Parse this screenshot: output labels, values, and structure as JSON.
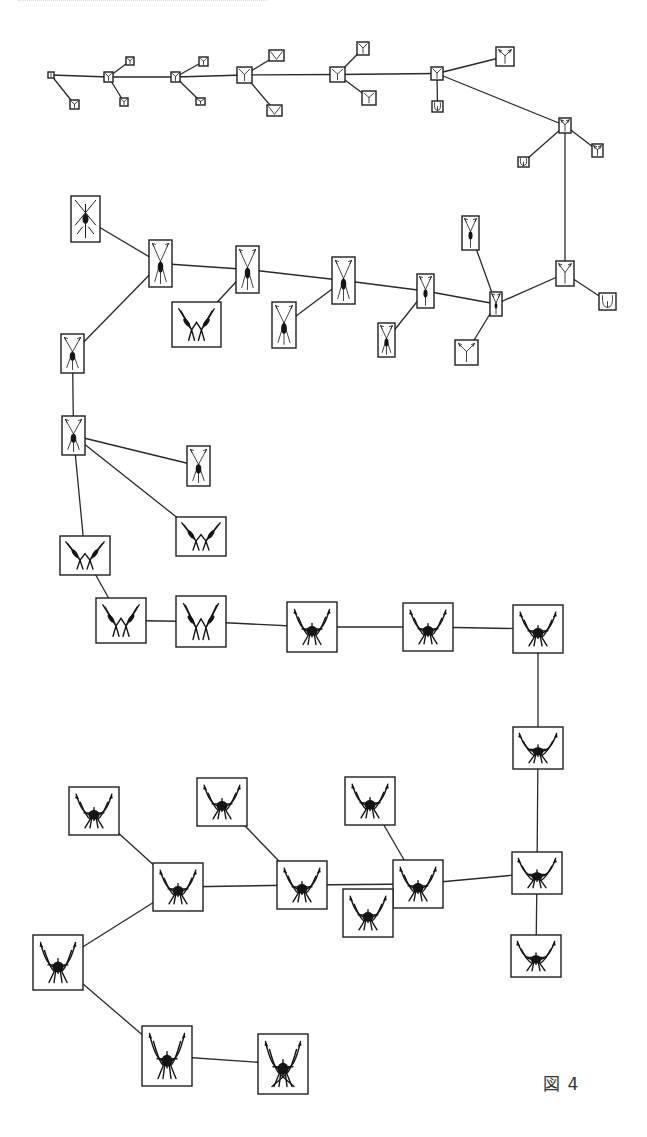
{
  "figure": {
    "caption": "図 4",
    "colors": {
      "line": "#2a2a2a",
      "box": "#1e1e1e",
      "glyph": "#151515",
      "background": "#ffffff"
    }
  },
  "nodes": [
    {
      "id": "n0",
      "x": 48,
      "y": 72,
      "w": 6,
      "h": 6,
      "gen": 0
    },
    {
      "id": "n0a",
      "x": 70,
      "y": 100,
      "w": 9,
      "h": 9,
      "gen": 0
    },
    {
      "id": "n1",
      "x": 104,
      "y": 72,
      "w": 9,
      "h": 10,
      "gen": 1
    },
    {
      "id": "n1a",
      "x": 126,
      "y": 57,
      "w": 8,
      "h": 8,
      "gen": 1
    },
    {
      "id": "n1b",
      "x": 120,
      "y": 98,
      "w": 8,
      "h": 8,
      "gen": 1
    },
    {
      "id": "n2",
      "x": 171,
      "y": 72,
      "w": 9,
      "h": 10,
      "gen": 1
    },
    {
      "id": "n2a",
      "x": 199,
      "y": 57,
      "w": 9,
      "h": 9,
      "gen": 1
    },
    {
      "id": "n2b",
      "x": 196,
      "y": 98,
      "w": 9,
      "h": 7,
      "gen": 0
    },
    {
      "id": "n3",
      "x": 237,
      "y": 67,
      "w": 15,
      "h": 16,
      "gen": 2
    },
    {
      "id": "n3a",
      "x": 269,
      "y": 50,
      "w": 15,
      "h": 11,
      "gen": 2,
      "shape": "v"
    },
    {
      "id": "n3b",
      "x": 267,
      "y": 105,
      "w": 15,
      "h": 11,
      "gen": 2,
      "shape": "v"
    },
    {
      "id": "n4",
      "x": 330,
      "y": 67,
      "w": 15,
      "h": 15,
      "gen": 2
    },
    {
      "id": "n4a",
      "x": 357,
      "y": 42,
      "w": 12,
      "h": 13,
      "gen": 2
    },
    {
      "id": "n4b",
      "x": 362,
      "y": 91,
      "w": 14,
      "h": 14,
      "gen": 2
    },
    {
      "id": "n5",
      "x": 431,
      "y": 67,
      "w": 12,
      "h": 13,
      "gen": 2
    },
    {
      "id": "n5a",
      "x": 432,
      "y": 101,
      "w": 11,
      "h": 11,
      "gen": 2,
      "shape": "u"
    },
    {
      "id": "n5b",
      "x": 496,
      "y": 47,
      "w": 18,
      "h": 19,
      "gen": 3
    },
    {
      "id": "n6",
      "x": 559,
      "y": 118,
      "w": 12,
      "h": 15,
      "gen": 3
    },
    {
      "id": "n6a",
      "x": 518,
      "y": 157,
      "w": 11,
      "h": 10,
      "gen": 2,
      "shape": "u"
    },
    {
      "id": "n6b",
      "x": 592,
      "y": 144,
      "w": 11,
      "h": 13,
      "gen": 3
    },
    {
      "id": "n7",
      "x": 556,
      "y": 261,
      "w": 18,
      "h": 25,
      "gen": 3
    },
    {
      "id": "n7a",
      "x": 599,
      "y": 293,
      "w": 17,
      "h": 17,
      "gen": 3,
      "shape": "u"
    },
    {
      "id": "n8",
      "x": 490,
      "y": 292,
      "w": 12,
      "h": 24,
      "gen": 4
    },
    {
      "id": "n8a",
      "x": 462,
      "y": 216,
      "w": 17,
      "h": 34,
      "gen": 4
    },
    {
      "id": "n8b",
      "x": 455,
      "y": 340,
      "w": 23,
      "h": 25,
      "gen": 3
    },
    {
      "id": "n9",
      "x": 417,
      "y": 274,
      "w": 17,
      "h": 34,
      "gen": 4
    },
    {
      "id": "n9a",
      "x": 378,
      "y": 323,
      "w": 17,
      "h": 34,
      "gen": 5
    },
    {
      "id": "n10",
      "x": 332,
      "y": 257,
      "w": 23,
      "h": 47,
      "gen": 5
    },
    {
      "id": "n10a",
      "x": 272,
      "y": 302,
      "w": 24,
      "h": 46,
      "gen": 5
    },
    {
      "id": "n11",
      "x": 236,
      "y": 246,
      "w": 23,
      "h": 47,
      "gen": 6
    },
    {
      "id": "n11a",
      "x": 172,
      "y": 302,
      "w": 49,
      "h": 45,
      "gen": 7,
      "shape": "w"
    },
    {
      "id": "n12",
      "x": 149,
      "y": 240,
      "w": 23,
      "h": 47,
      "gen": 6
    },
    {
      "id": "n12a",
      "x": 71,
      "y": 196,
      "w": 29,
      "h": 46,
      "gen": 6,
      "shape": "x"
    },
    {
      "id": "n13",
      "x": 61,
      "y": 334,
      "w": 23,
      "h": 39,
      "gen": 6
    },
    {
      "id": "n14",
      "x": 62,
      "y": 416,
      "w": 23,
      "h": 39,
      "gen": 6
    },
    {
      "id": "n14a",
      "x": 187,
      "y": 446,
      "w": 23,
      "h": 40,
      "gen": 6
    },
    {
      "id": "n14b",
      "x": 176,
      "y": 517,
      "w": 50,
      "h": 39,
      "gen": 7,
      "shape": "w"
    },
    {
      "id": "n15",
      "x": 60,
      "y": 536,
      "w": 50,
      "h": 39,
      "gen": 7,
      "shape": "w"
    },
    {
      "id": "n16",
      "x": 96,
      "y": 598,
      "w": 50,
      "h": 45,
      "gen": 8,
      "shape": "w"
    },
    {
      "id": "n17",
      "x": 176,
      "y": 596,
      "w": 50,
      "h": 51,
      "gen": 8,
      "shape": "w"
    },
    {
      "id": "n18",
      "x": 287,
      "y": 602,
      "w": 50,
      "h": 50,
      "gen": 9,
      "shape": "bug"
    },
    {
      "id": "n19",
      "x": 403,
      "y": 603,
      "w": 50,
      "h": 48,
      "gen": 9,
      "shape": "bug"
    },
    {
      "id": "n20",
      "x": 513,
      "y": 605,
      "w": 50,
      "h": 48,
      "gen": 10,
      "shape": "bug"
    },
    {
      "id": "n21",
      "x": 513,
      "y": 727,
      "w": 50,
      "h": 42,
      "gen": 10,
      "shape": "bug"
    },
    {
      "id": "n22",
      "x": 512,
      "y": 852,
      "w": 50,
      "h": 42,
      "gen": 10,
      "shape": "bug"
    },
    {
      "id": "n22a",
      "x": 511,
      "y": 935,
      "w": 50,
      "h": 42,
      "gen": 11,
      "shape": "bug"
    },
    {
      "id": "n23",
      "x": 393,
      "y": 860,
      "w": 50,
      "h": 48,
      "gen": 10,
      "shape": "bug"
    },
    {
      "id": "n23a",
      "x": 345,
      "y": 777,
      "w": 50,
      "h": 48,
      "gen": 11,
      "shape": "bug"
    },
    {
      "id": "n23b",
      "x": 343,
      "y": 889,
      "w": 50,
      "h": 48,
      "gen": 10,
      "shape": "bug"
    },
    {
      "id": "n24",
      "x": 277,
      "y": 861,
      "w": 50,
      "h": 48,
      "gen": 11,
      "shape": "bug"
    },
    {
      "id": "n24a",
      "x": 197,
      "y": 778,
      "w": 50,
      "h": 48,
      "gen": 11,
      "shape": "bug"
    },
    {
      "id": "n25",
      "x": 153,
      "y": 863,
      "w": 50,
      "h": 48,
      "gen": 11,
      "shape": "bug"
    },
    {
      "id": "n25a",
      "x": 69,
      "y": 787,
      "w": 50,
      "h": 48,
      "gen": 11,
      "shape": "bug"
    },
    {
      "id": "n26",
      "x": 33,
      "y": 935,
      "w": 50,
      "h": 55,
      "gen": 11,
      "shape": "bug"
    },
    {
      "id": "n27",
      "x": 142,
      "y": 1026,
      "w": 50,
      "h": 60,
      "gen": 12,
      "shape": "bug"
    },
    {
      "id": "n28",
      "x": 258,
      "y": 1034,
      "w": 50,
      "h": 60,
      "gen": 12,
      "shape": "bugx"
    }
  ],
  "edges": [
    [
      "n0",
      "n1"
    ],
    [
      "n0",
      "n0a"
    ],
    [
      "n1",
      "n1a"
    ],
    [
      "n1",
      "n1b"
    ],
    [
      "n1",
      "n2"
    ],
    [
      "n2",
      "n2a"
    ],
    [
      "n2",
      "n2b"
    ],
    [
      "n2",
      "n3"
    ],
    [
      "n3",
      "n3a"
    ],
    [
      "n3",
      "n3b"
    ],
    [
      "n3",
      "n4"
    ],
    [
      "n4",
      "n4a"
    ],
    [
      "n4",
      "n4b"
    ],
    [
      "n4",
      "n5"
    ],
    [
      "n5",
      "n5a"
    ],
    [
      "n5",
      "n5b"
    ],
    [
      "n5",
      "n6"
    ],
    [
      "n6",
      "n6a"
    ],
    [
      "n6",
      "n6b"
    ],
    [
      "n6",
      "n7"
    ],
    [
      "n7",
      "n7a"
    ],
    [
      "n7",
      "n8"
    ],
    [
      "n8",
      "n8a"
    ],
    [
      "n8",
      "n8b"
    ],
    [
      "n8",
      "n9"
    ],
    [
      "n9",
      "n9a"
    ],
    [
      "n9",
      "n10"
    ],
    [
      "n10",
      "n10a"
    ],
    [
      "n10",
      "n11"
    ],
    [
      "n11",
      "n11a"
    ],
    [
      "n11",
      "n12"
    ],
    [
      "n12",
      "n12a"
    ],
    [
      "n12",
      "n13"
    ],
    [
      "n13",
      "n14"
    ],
    [
      "n14",
      "n14a"
    ],
    [
      "n14",
      "n14b"
    ],
    [
      "n14",
      "n15"
    ],
    [
      "n15",
      "n16"
    ],
    [
      "n16",
      "n17"
    ],
    [
      "n17",
      "n18"
    ],
    [
      "n18",
      "n19"
    ],
    [
      "n19",
      "n20"
    ],
    [
      "n20",
      "n21"
    ],
    [
      "n21",
      "n22"
    ],
    [
      "n22",
      "n22a"
    ],
    [
      "n22",
      "n23"
    ],
    [
      "n23",
      "n23a"
    ],
    [
      "n23",
      "n23b"
    ],
    [
      "n23",
      "n24"
    ],
    [
      "n24",
      "n24a"
    ],
    [
      "n24",
      "n25"
    ],
    [
      "n25",
      "n25a"
    ],
    [
      "n25",
      "n26"
    ],
    [
      "n26",
      "n27"
    ],
    [
      "n27",
      "n28"
    ]
  ]
}
